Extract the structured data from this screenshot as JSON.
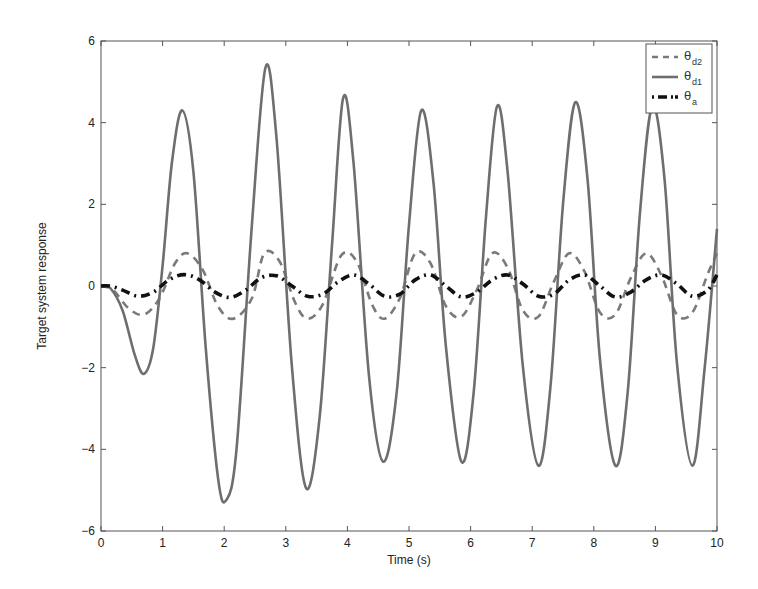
{
  "chart_data": {
    "type": "line",
    "title": "",
    "xlabel": "Time (s)",
    "ylabel": "Target system response",
    "xlim": [
      0,
      10
    ],
    "ylim": [
      -6,
      6
    ],
    "xticks": [
      "0",
      "1",
      "2",
      "3",
      "4",
      "5",
      "6",
      "7",
      "8",
      "9",
      "10"
    ],
    "yticks": [
      "-6",
      "-4",
      "-2",
      "0",
      "2",
      "4",
      "6"
    ],
    "grid": false,
    "legend_position": "upper right",
    "series": [
      {
        "name": "θd2",
        "label_main": "θ",
        "label_sub": "d2",
        "style": "dashed",
        "color": "#7a7a7a",
        "x": [
          0,
          0.2,
          0.45,
          0.7,
          0.95,
          1.2,
          1.4,
          1.65,
          1.9,
          2.15,
          2.45,
          2.65,
          2.9,
          3.15,
          3.35,
          3.6,
          3.9,
          4.15,
          4.4,
          4.6,
          4.85,
          5.1,
          5.35,
          5.6,
          5.85,
          6.1,
          6.35,
          6.6,
          6.85,
          7.1,
          7.35,
          7.6,
          7.85,
          8.1,
          8.35,
          8.6,
          8.85,
          9.1,
          9.35,
          9.6,
          9.85,
          10
        ],
        "y": [
          0,
          -0.1,
          -0.55,
          -0.7,
          -0.3,
          0.55,
          0.8,
          0.4,
          -0.5,
          -0.8,
          -0.3,
          0.8,
          0.6,
          -0.4,
          -0.8,
          -0.45,
          0.75,
          0.6,
          -0.45,
          -0.8,
          -0.3,
          0.8,
          0.55,
          -0.5,
          -0.75,
          -0.1,
          0.8,
          0.45,
          -0.6,
          -0.75,
          0.1,
          0.8,
          0.35,
          -0.65,
          -0.7,
          0.2,
          0.8,
          0.25,
          -0.7,
          -0.65,
          0.3,
          0.8
        ]
      },
      {
        "name": "θd1",
        "label_main": "θ",
        "label_sub": "d1",
        "style": "solid",
        "color": "#6e6e6e",
        "x": [
          0,
          0.15,
          0.35,
          0.55,
          0.7,
          0.85,
          1.0,
          1.15,
          1.32,
          1.5,
          1.7,
          1.9,
          2.03,
          2.2,
          2.45,
          2.67,
          2.85,
          3.1,
          3.33,
          3.55,
          3.75,
          3.93,
          4.1,
          4.35,
          4.58,
          4.8,
          5.0,
          5.2,
          5.4,
          5.6,
          5.85,
          6.05,
          6.25,
          6.43,
          6.6,
          6.85,
          7.1,
          7.3,
          7.5,
          7.7,
          7.9,
          8.1,
          8.35,
          8.55,
          8.75,
          8.95,
          9.15,
          9.35,
          9.6,
          9.8,
          10
        ],
        "y": [
          0,
          -0.05,
          -0.6,
          -1.7,
          -2.15,
          -1.5,
          0.5,
          3.0,
          4.3,
          2.8,
          -1.5,
          -4.7,
          -5.25,
          -4.0,
          1.5,
          5.35,
          3.6,
          -2.0,
          -4.95,
          -3.2,
          1.0,
          4.6,
          3.0,
          -2.2,
          -4.3,
          -2.6,
          1.5,
          4.3,
          2.5,
          -1.5,
          -4.3,
          -2.6,
          1.7,
          4.4,
          2.8,
          -2.0,
          -4.4,
          -2.4,
          2.0,
          4.5,
          2.6,
          -1.8,
          -4.4,
          -2.6,
          1.8,
          4.4,
          2.6,
          -1.9,
          -4.4,
          -2.0,
          1.4
        ]
      },
      {
        "name": "θa",
        "label_main": "θ",
        "label_sub": "a",
        "style": "dashdot",
        "color": "#111111",
        "x": [
          0,
          0.15,
          0.35,
          0.6,
          0.85,
          1.1,
          1.35,
          1.6,
          1.85,
          2.1,
          2.35,
          2.6,
          2.85,
          3.1,
          3.35,
          3.6,
          3.85,
          4.1,
          4.35,
          4.6,
          4.85,
          5.1,
          5.35,
          5.6,
          5.85,
          6.1,
          6.35,
          6.6,
          6.85,
          7.1,
          7.35,
          7.6,
          7.85,
          8.1,
          8.35,
          8.6,
          8.85,
          9.1,
          9.35,
          9.6,
          9.85,
          10
        ],
        "y": [
          0,
          0,
          -0.1,
          -0.25,
          -0.15,
          0.15,
          0.28,
          0.15,
          -0.15,
          -0.28,
          -0.1,
          0.2,
          0.25,
          0.0,
          -0.25,
          -0.2,
          0.1,
          0.27,
          0.05,
          -0.25,
          -0.2,
          0.15,
          0.27,
          0.0,
          -0.27,
          -0.15,
          0.15,
          0.27,
          0.05,
          -0.25,
          -0.2,
          0.15,
          0.27,
          0.0,
          -0.27,
          -0.15,
          0.15,
          0.27,
          0.05,
          -0.25,
          -0.1,
          0.28
        ]
      }
    ]
  }
}
